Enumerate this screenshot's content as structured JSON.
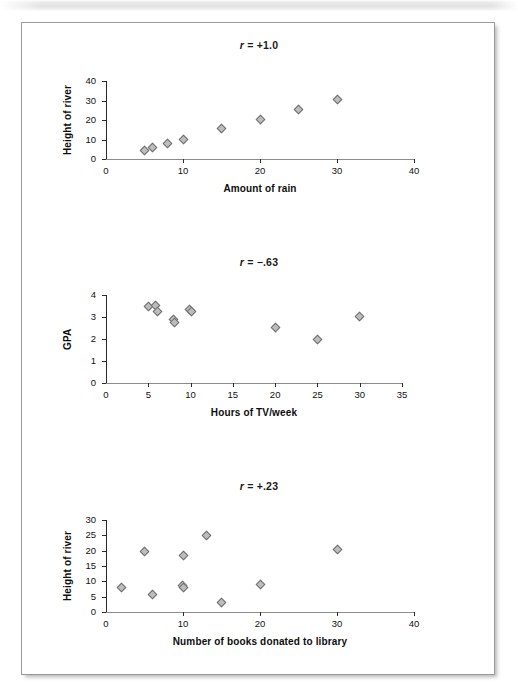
{
  "figure": {
    "background_color": "#ffffff",
    "frame_border_color": "#9a9a9a",
    "marker_fill": "#bdbdbd",
    "marker_stroke": "#6e6e6e"
  },
  "chart_data": [
    {
      "type": "scatter",
      "title": "r = +1.0",
      "title_symbol": "r",
      "title_value": "= +1.0",
      "xlabel": "Amount of rain",
      "ylabel": "Height of river",
      "xlim": [
        0,
        40
      ],
      "ylim": [
        0,
        40
      ],
      "xticks": [
        0,
        10,
        20,
        30,
        40
      ],
      "yticks": [
        0,
        10,
        20,
        30,
        40
      ],
      "xtick_labels": [
        "0",
        "10",
        "20",
        "30",
        "40"
      ],
      "ytick_labels": [
        "0",
        "10",
        "20",
        "30",
        "40"
      ],
      "grid": false,
      "legend": false,
      "points": [
        {
          "x": 5,
          "y": 4.5
        },
        {
          "x": 6,
          "y": 6.0
        },
        {
          "x": 8,
          "y": 8.0
        },
        {
          "x": 10,
          "y": 10.2
        },
        {
          "x": 15,
          "y": 15.4
        },
        {
          "x": 20,
          "y": 20.2
        },
        {
          "x": 25,
          "y": 25.3
        },
        {
          "x": 30,
          "y": 30.3
        }
      ]
    },
    {
      "type": "scatter",
      "title": "r = −.63",
      "title_symbol": "r",
      "title_value": "= −.63",
      "xlabel": "Hours of TV/week",
      "ylabel": "GPA",
      "xlim": [
        0,
        35
      ],
      "ylim": [
        0,
        4
      ],
      "xticks": [
        0,
        5,
        10,
        15,
        20,
        25,
        30,
        35
      ],
      "yticks": [
        0,
        1,
        2,
        3,
        4
      ],
      "xtick_labels": [
        "0",
        "5",
        "10",
        "15",
        "20",
        "25",
        "30",
        "35"
      ],
      "ytick_labels": [
        "0",
        "1",
        "2",
        "3",
        "4"
      ],
      "grid": false,
      "legend": false,
      "points": [
        {
          "x": 5.0,
          "y": 3.48
        },
        {
          "x": 5.9,
          "y": 3.52
        },
        {
          "x": 6.1,
          "y": 3.25
        },
        {
          "x": 8.0,
          "y": 2.88
        },
        {
          "x": 8.1,
          "y": 2.75
        },
        {
          "x": 9.9,
          "y": 3.35
        },
        {
          "x": 10.1,
          "y": 3.26
        },
        {
          "x": 20.0,
          "y": 2.53
        },
        {
          "x": 25.0,
          "y": 1.97
        },
        {
          "x": 30.0,
          "y": 3.03
        }
      ]
    },
    {
      "type": "scatter",
      "title": "r = +.23",
      "title_symbol": "r",
      "title_value": "= +.23",
      "xlabel": "Number of books donated to library",
      "ylabel": "Height of river",
      "xlim": [
        0,
        40
      ],
      "ylim": [
        0,
        30
      ],
      "xticks": [
        0,
        10,
        20,
        30,
        40
      ],
      "yticks": [
        0,
        5,
        10,
        15,
        20,
        25,
        30
      ],
      "xtick_labels": [
        "0",
        "10",
        "20",
        "30",
        "40"
      ],
      "ytick_labels": [
        "0",
        "5",
        "10",
        "15",
        "20",
        "25",
        "30"
      ],
      "grid": false,
      "legend": false,
      "points": [
        {
          "x": 2,
          "y": 8.0
        },
        {
          "x": 5,
          "y": 19.6
        },
        {
          "x": 6,
          "y": 5.8
        },
        {
          "x": 9.9,
          "y": 8.7
        },
        {
          "x": 10.1,
          "y": 7.9
        },
        {
          "x": 10,
          "y": 18.4
        },
        {
          "x": 13,
          "y": 25.1
        },
        {
          "x": 15,
          "y": 3.0
        },
        {
          "x": 20,
          "y": 9.0
        },
        {
          "x": 30,
          "y": 20.4
        }
      ]
    }
  ]
}
